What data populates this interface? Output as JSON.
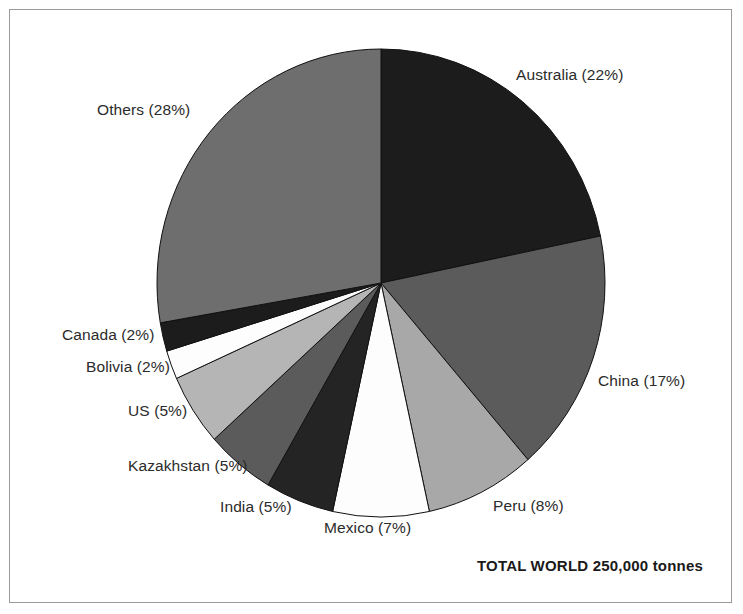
{
  "figure": {
    "background_color": "#ffffff",
    "border_color": "#9a9a9a",
    "total_note": "TOTAL WORLD 250,000 tonnes"
  },
  "chart_data": {
    "type": "pie",
    "title": "",
    "subtitle": "",
    "xlabel": "",
    "ylabel": "",
    "grid": false,
    "legend_position": "outside-callout-labels",
    "total_label": "TOTAL WORLD 250,000 tonnes",
    "total_value": 250000,
    "total_units": "tonnes",
    "start_angle_deg": 0,
    "direction": "clockwise",
    "categories": [
      "Australia",
      "China",
      "Peru",
      "Mexico",
      "India",
      "Kazakhstan",
      "US",
      "Bolivia",
      "Canada",
      "Others"
    ],
    "values": [
      22,
      17,
      8,
      7,
      5,
      5,
      5,
      2,
      2,
      28
    ],
    "value_units": "percent",
    "slices": [
      {
        "label": "Australia (22%)",
        "name": "Australia",
        "value": 22,
        "color": "#1c1c1c",
        "label_x": 516,
        "label_y": 66,
        "label_side": "right"
      },
      {
        "label": "China (17%)",
        "name": "China",
        "value": 17,
        "color": "#5b5b5b",
        "label_x": 598,
        "label_y": 372,
        "label_side": "right"
      },
      {
        "label": "Peru (8%)",
        "name": "Peru",
        "value": 8,
        "color": "#a8a8a8",
        "label_x": 493,
        "label_y": 497,
        "label_side": "right"
      },
      {
        "label": "Mexico (7%)",
        "name": "Mexico",
        "value": 7,
        "color": "#fdfdfd",
        "label_x": 324,
        "label_y": 519,
        "label_side": "right"
      },
      {
        "label": "India (5%)",
        "name": "India",
        "value": 5,
        "color": "#242424",
        "label_x": 220,
        "label_y": 498,
        "label_side": "right"
      },
      {
        "label": "Kazakhstan (5%)",
        "name": "Kazakhstan",
        "value": 5,
        "color": "#5b5b5b",
        "label_x": 128,
        "label_y": 457,
        "label_side": "right"
      },
      {
        "label": "US (5%)",
        "name": "US",
        "value": 5,
        "color": "#b5b5b5",
        "label_x": 128,
        "label_y": 402,
        "label_side": "right"
      },
      {
        "label": "Bolivia (2%)",
        "name": "Bolivia",
        "value": 2,
        "color": "#fdfdfd",
        "label_x": 86,
        "label_y": 358,
        "label_side": "right"
      },
      {
        "label": "Canada (2%)",
        "name": "Canada",
        "value": 2,
        "color": "#1c1c1c",
        "label_x": 62,
        "label_y": 326,
        "label_side": "right"
      },
      {
        "label": "Others (28%)",
        "name": "Others",
        "value": 28,
        "color": "#6e6e6e",
        "label_x": 97,
        "label_y": 101,
        "label_side": "right"
      }
    ],
    "geometry": {
      "center_x": 381,
      "center_y": 283,
      "radius_x": 224,
      "radius_y": 234,
      "stroke_color": "#111111",
      "stroke_width": 1
    }
  }
}
